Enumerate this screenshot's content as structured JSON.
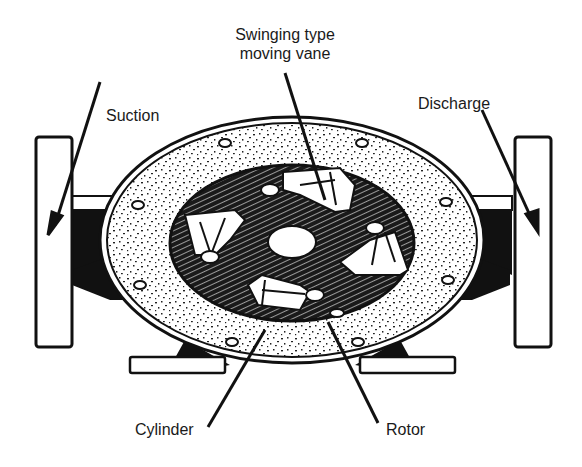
{
  "diagram": {
    "labels": {
      "vane": [
        "Swinging type",
        "moving vane"
      ],
      "suction": "Suction",
      "discharge": "Discharge",
      "cylinder": "Cylinder",
      "rotor": "Rotor"
    },
    "colors": {
      "ink": "#111111",
      "paper": "#ffffff"
    }
  }
}
